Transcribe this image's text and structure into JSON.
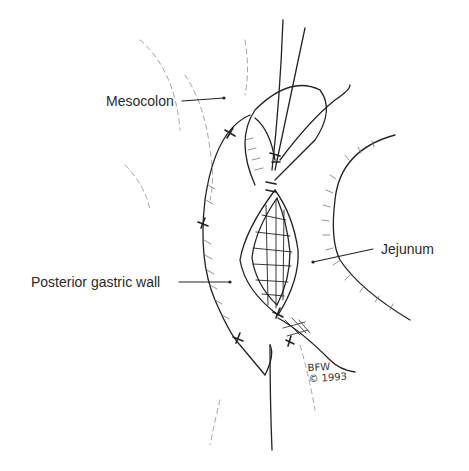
{
  "diagram": {
    "labels": {
      "mesocolon": "Mesocolon",
      "posterior_gastric_wall": "Posterior gastric wall",
      "jejunum": "Jejunum"
    },
    "signature": {
      "initials": "BFW",
      "copyright": "© 1993"
    },
    "colors": {
      "ink": "#222222",
      "faint_ink": "#888888",
      "background": "#ffffff"
    }
  }
}
